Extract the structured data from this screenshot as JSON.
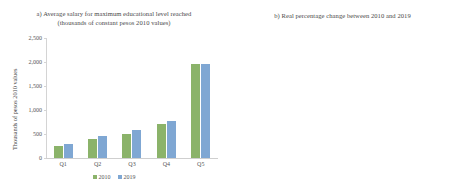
{
  "chart_data": [
    {
      "type": "bar",
      "panel": "a",
      "title": "a) Average salary for maximum educational level reached",
      "subtitle": "(thousands of constant pesos 2010 values)",
      "xlabel": "",
      "ylabel": "Thousands of pesos 2010 values",
      "ylim": [
        0,
        2500
      ],
      "yticks": [
        "0",
        "500",
        "1,000",
        "1,500",
        "2,000",
        "2,500"
      ],
      "ytick_values": [
        0,
        500,
        1000,
        1500,
        2000,
        2500
      ],
      "grid": false,
      "legend_position": "bottom-center",
      "categories": [
        "Q1",
        "Q2",
        "Q3",
        "Q4",
        "Q5"
      ],
      "series": [
        {
          "name": "2010",
          "color": "#8bb36a",
          "values": [
            250,
            405,
            510,
            700,
            1950
          ]
        },
        {
          "name": "2019",
          "color": "#7fa7d3",
          "values": [
            300,
            460,
            580,
            780,
            1960
          ]
        }
      ]
    },
    {
      "type": "bar",
      "panel": "b",
      "title": "b) Real percentage change between 2010 and 2019",
      "subtitle": "",
      "xlabel": "",
      "ylabel": "Percentage change (%)",
      "ylim": [
        -2.0,
        18.0
      ],
      "yticks": [
        "-2.0",
        "0.0",
        "2.0",
        "4.0",
        "6.0",
        "8.0",
        "10.0",
        "12.0",
        "14.0",
        "16.0",
        "18.0"
      ],
      "ytick_values": [
        -2.0,
        0.0,
        2.0,
        4.0,
        6.0,
        8.0,
        10.0,
        12.0,
        14.0,
        16.0,
        18.0
      ],
      "grid": false,
      "legend_position": "none",
      "bar_fill": "#eaf1fa",
      "bar_border": "#6f9bd1",
      "categories": [
        "Q1",
        "Q2",
        "Q3",
        "Q4",
        "Q5"
      ],
      "values": [
        15.7,
        16.9,
        12.1,
        9.3,
        -0.4
      ],
      "data_labels": [
        "15.7",
        "16.9",
        "12.1",
        "9.3",
        "-0.4"
      ]
    }
  ]
}
